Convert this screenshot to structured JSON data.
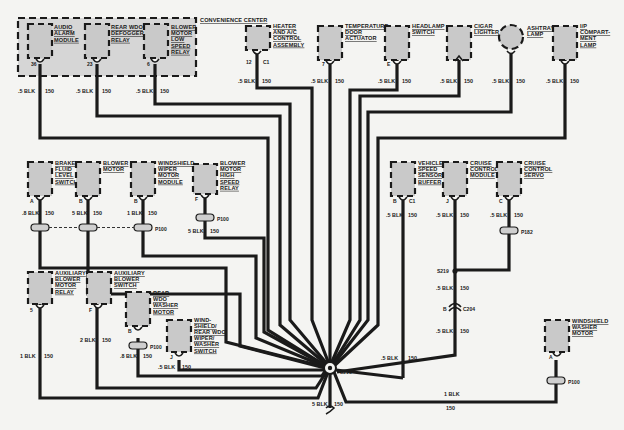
{
  "diagram": {
    "convenience_center": {
      "label": "CONVENIENCE CENTER"
    },
    "components": [
      {
        "id": "audio-alarm-module",
        "lines": [
          "AUDIO",
          "ALARM",
          "MODULE"
        ],
        "pin": "36",
        "wire": ".5 BLK",
        "circuit": "150"
      },
      {
        "id": "rear-wdo-defogger-relay",
        "lines": [
          "REAR WDO",
          "DEFOGGER",
          "RELAY"
        ],
        "pin": "23",
        "wire": ".5 BLK",
        "circuit": "150"
      },
      {
        "id": "blower-motor-low-speed-relay",
        "lines": [
          "BLOWER",
          "MOTOR",
          "LOW",
          "SPEED",
          "RELAY"
        ],
        "pin": "6",
        "wire": ".5 BLK",
        "circuit": "150"
      },
      {
        "id": "heater-ac-control-assembly",
        "lines": [
          "HEATER",
          "AND A/C",
          "CONTROL",
          "ASSEMBLY"
        ],
        "pin": "12",
        "connector": "C1",
        "wire": ".5 BLK",
        "circuit": "150"
      },
      {
        "id": "temperature-door-actuator",
        "lines": [
          "TEMPERATURE",
          "DOOR",
          "ACTUATOR"
        ],
        "pin": "7",
        "wire": ".5 BLK",
        "circuit": "150"
      },
      {
        "id": "headlamp-switch",
        "lines": [
          "HEADLAMP",
          "SWITCH"
        ],
        "pin": "E",
        "wire": ".5 BLK",
        "circuit": "150"
      },
      {
        "id": "cigar-lighter",
        "lines": [
          "CIGAR",
          "LIGHTER"
        ],
        "wire": ".5 BLK",
        "circuit": "150"
      },
      {
        "id": "ashtray-lamp",
        "lines": [
          "ASHTRAY",
          "LAMP"
        ],
        "wire": ".5 BLK",
        "circuit": "150"
      },
      {
        "id": "ip-compartment-lamp",
        "lines": [
          "I/P",
          "COMPART-",
          "MENT",
          "LAMP"
        ],
        "wire": ".5 BLK",
        "circuit": "150"
      },
      {
        "id": "brake-fluid-level-switch",
        "lines": [
          "BRAKE",
          "FLUID",
          "LEVEL",
          "SWITCH"
        ],
        "pin": "A",
        "wire": ".8 BLK",
        "circuit": "150"
      },
      {
        "id": "blower-motor",
        "lines": [
          "BLOWER",
          "MOTOR"
        ],
        "pin": "B",
        "wire": "5 BLK",
        "circuit": "150"
      },
      {
        "id": "windshield-wiper-motor-module",
        "lines": [
          "WINDSHIELD",
          "WIPER",
          "MOTOR",
          "MODULE"
        ],
        "pin": "B",
        "wire": "1 BLK",
        "circuit": "150",
        "connector": "P100"
      },
      {
        "id": "blower-motor-high-speed-relay",
        "lines": [
          "BLOWER",
          "MOTOR",
          "HIGH",
          "SPEED",
          "RELAY"
        ],
        "pin": "F",
        "wire": "5 BLK",
        "circuit": "150",
        "connector": "P100"
      },
      {
        "id": "vehicle-speed-sensor-buffer",
        "lines": [
          "VEHICLE",
          "SPEED",
          "SENSOR",
          "BUFFER"
        ],
        "pin": "B",
        "connector": "C1",
        "wire": ".5 BLK",
        "circuit": "150"
      },
      {
        "id": "cruise-control-module",
        "lines": [
          "CRUISE",
          "CONTROL",
          "MODULE"
        ],
        "pin": "J",
        "wire": ".5 BLK",
        "circuit": "150"
      },
      {
        "id": "cruise-control-servo",
        "lines": [
          "CRUISE",
          "CONTROL",
          "SERVO"
        ],
        "pin": "C",
        "wire": ".5 BLK",
        "circuit": "150",
        "connector": "P182"
      },
      {
        "id": "auxiliary-blower-motor-relay",
        "lines": [
          "AUXILIARY",
          "BLOWER",
          "MOTOR",
          "RELAY"
        ],
        "pin": "5",
        "wire": "1 BLK",
        "circuit": "150"
      },
      {
        "id": "auxiliary-blower-switch",
        "lines": [
          "AUXILIARY",
          "BLOWER",
          "SWITCH"
        ],
        "pin": "F",
        "wire": "2 BLK",
        "circuit": "150"
      },
      {
        "id": "rear-wdo-washer-motor",
        "lines": [
          "REAR",
          "WDO",
          "WASHER",
          "MOTOR"
        ],
        "pin": "B",
        "wire": ".8 BLK",
        "circuit": "150",
        "connector": "P100"
      },
      {
        "id": "windshield-rear-wdo-wiper-washer-switch",
        "lines": [
          "WIND-",
          "SHIELD/",
          "REAR WDO",
          "WIPER/",
          "WASHER",
          "SWITCH"
        ],
        "pin": "J",
        "wire": ".5 BLK",
        "circuit": "150"
      },
      {
        "id": "windshield-washer-motor",
        "lines": [
          "WINDSHIELD",
          "WASHER",
          "MOTOR"
        ],
        "pin": "A",
        "wire": "1 BLK",
        "circuit": "150",
        "connector": "P100"
      }
    ],
    "splices": [
      {
        "id": "S218",
        "label": "S218"
      },
      {
        "id": "S219",
        "label": "S219"
      }
    ],
    "inline_connectors": [
      {
        "id": "C204",
        "label": "C204",
        "pin": "B"
      }
    ],
    "cruise_trunk": {
      "upper_wire": ".5 BLK",
      "upper_circuit": "150",
      "lower_wire": ".5 BLK",
      "lower_circuit": "150"
    },
    "ground": {
      "wire": "5 BLK",
      "circuit": "150"
    },
    "washer_return": {
      "wire": "1 BLK",
      "circuit": "150"
    }
  }
}
